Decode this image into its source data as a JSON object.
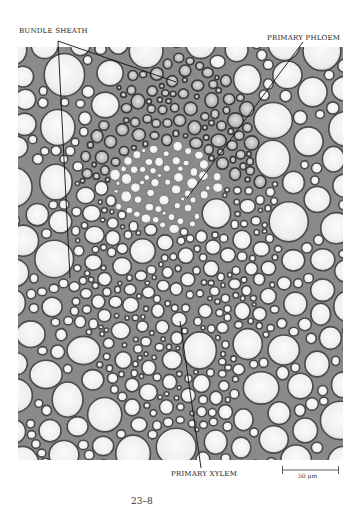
{
  "figure": {
    "number": "23–8",
    "labels": {
      "bundle_sheath": "BUNDLE SHEATH",
      "primary_phloem": "PRIMARY PHLOEM",
      "primary_xylem": "PRIMARY XYLEM"
    },
    "scale_bar": {
      "text": "50 μm"
    }
  },
  "colors": {
    "cell_wall": "#555555",
    "cell_lumen": "#f4f4f4",
    "sheath_dark": "#6e6e6e",
    "phloem_light": "#ececec",
    "leader_line": "#111111"
  }
}
